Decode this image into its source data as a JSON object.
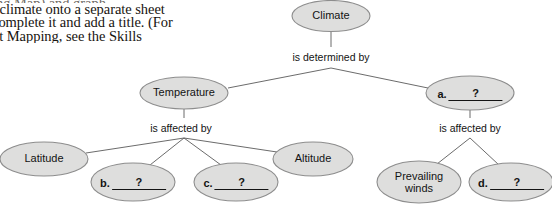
{
  "excerpt": {
    "lines": [
      "ing Map) and graph...",
      "t climate onto a separate sheet",
      "complete it and add a title. (For",
      "pt Mapping, see the Skills"
    ]
  },
  "concept_map": {
    "nodes": [
      {
        "id": "climate",
        "label": "Climate",
        "cx": 331,
        "cy": 16,
        "rx": 39,
        "ry": 15.5,
        "kind": "text"
      },
      {
        "id": "temperature",
        "label": "Temperature",
        "cx": 184,
        "cy": 93,
        "rx": 44,
        "ry": 16,
        "kind": "text"
      },
      {
        "id": "answer-a",
        "letter": "a.",
        "value": "?",
        "cx": 470,
        "cy": 93,
        "rx": 44,
        "ry": 17,
        "kind": "blank"
      },
      {
        "id": "latitude",
        "label": "Latitude",
        "cx": 44,
        "cy": 159,
        "rx": 44,
        "ry": 17,
        "kind": "text"
      },
      {
        "id": "answer-b",
        "letter": "b.",
        "value": "?",
        "cx": 133,
        "cy": 182,
        "rx": 42,
        "ry": 19,
        "kind": "blank"
      },
      {
        "id": "answer-c",
        "letter": "c.",
        "value": "?",
        "cx": 236,
        "cy": 182,
        "rx": 42,
        "ry": 19,
        "kind": "blank"
      },
      {
        "id": "altitude",
        "label": "Altitude",
        "cx": 313,
        "cy": 159,
        "rx": 40,
        "ry": 17,
        "kind": "text"
      },
      {
        "id": "prevailing",
        "label": "Prevailing\nwinds",
        "cx": 419,
        "cy": 182,
        "rx": 42,
        "ry": 21,
        "kind": "text"
      },
      {
        "id": "answer-d",
        "letter": "d.",
        "value": "?",
        "cx": 511,
        "cy": 182,
        "rx": 42,
        "ry": 19,
        "kind": "blank"
      }
    ],
    "edge_labels": [
      {
        "id": "determined-by",
        "text": "is determined by",
        "x": 331,
        "y": 57
      },
      {
        "id": "affected-by-left",
        "text": "is affected by",
        "x": 181,
        "y": 128
      },
      {
        "id": "affected-by-right",
        "text": "is affected by",
        "x": 470,
        "y": 128
      }
    ]
  }
}
